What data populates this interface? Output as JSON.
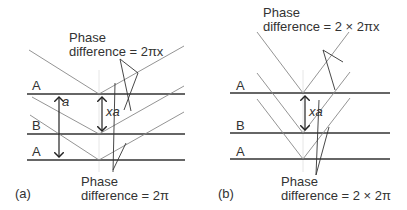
{
  "panel_a": {
    "caption": "(a)",
    "top_annotation": [
      "Phase",
      "difference = 2πx"
    ],
    "bottom_annotation": [
      "Phase",
      "difference = 2π"
    ],
    "planes": [
      "A",
      "B",
      "A"
    ],
    "spacing_label": "a",
    "offset_label": "xa"
  },
  "panel_b": {
    "caption": "(b)",
    "top_annotation": [
      "Phase",
      "difference = 2 × 2πx"
    ],
    "bottom_annotation": [
      "Phase",
      "difference = 2 × 2π"
    ],
    "planes": [
      "A",
      "B",
      "A"
    ],
    "offset_label": "xa"
  },
  "colors": {
    "plane": "#333333",
    "ray": "#888888",
    "guide": "#dddddd"
  }
}
